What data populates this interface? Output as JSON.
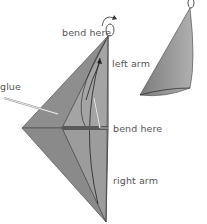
{
  "labels": {
    "bend_top": "bend here",
    "left_arm": "left arm",
    "glue": "glue",
    "bend_mid": "bend here",
    "right_arm": "right arm"
  },
  "colors": {
    "paper_dark": "#7a7a7a",
    "paper_mid": "#9a9a9a",
    "paper_light": "#b8b8b8",
    "outline": "#333333",
    "label_text": "#555555"
  }
}
